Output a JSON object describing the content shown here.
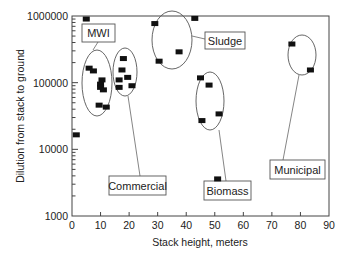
{
  "chart_data": {
    "type": "scatter",
    "title": "",
    "xlabel": "Stack height, meters",
    "ylabel": "Dilution from stack to ground",
    "xlim": [
      0,
      90
    ],
    "ylim": [
      1000,
      1000000
    ],
    "yscale": "log",
    "grid": false,
    "legend": "none",
    "x_ticks": [
      "0",
      "10",
      "20",
      "30",
      "40",
      "50",
      "60",
      "70",
      "80",
      "90"
    ],
    "y_ticks": [
      "1000",
      "10000",
      "100000",
      "1000000"
    ],
    "unlabeled_points": [
      {
        "x": 5,
        "y": 900000
      },
      {
        "x": 1.5,
        "y": 16500
      }
    ],
    "series": [
      {
        "name": "MWI",
        "points": [
          {
            "x": 6,
            "y": 165000
          },
          {
            "x": 7.5,
            "y": 150000
          },
          {
            "x": 10.5,
            "y": 110000
          },
          {
            "x": 10,
            "y": 95000
          },
          {
            "x": 10,
            "y": 85000
          },
          {
            "x": 11,
            "y": 78000
          },
          {
            "x": 9.5,
            "y": 46000
          },
          {
            "x": 12,
            "y": 43000
          }
        ]
      },
      {
        "name": "Commercial",
        "points": [
          {
            "x": 18,
            "y": 230000
          },
          {
            "x": 17.5,
            "y": 155000
          },
          {
            "x": 16.5,
            "y": 110000
          },
          {
            "x": 19.5,
            "y": 120000
          },
          {
            "x": 21,
            "y": 90000
          },
          {
            "x": 16.5,
            "y": 85000
          }
        ]
      },
      {
        "name": "Sludge",
        "points": [
          {
            "x": 29,
            "y": 770000
          },
          {
            "x": 43,
            "y": 920000
          },
          {
            "x": 37.5,
            "y": 290000
          },
          {
            "x": 30.5,
            "y": 210000
          }
        ]
      },
      {
        "name": "Biomass",
        "points": [
          {
            "x": 45,
            "y": 118000
          },
          {
            "x": 48,
            "y": 92000
          },
          {
            "x": 51.5,
            "y": 34000
          },
          {
            "x": 45.5,
            "y": 27000
          },
          {
            "x": 51,
            "y": 3600
          }
        ]
      },
      {
        "name": "Municipal",
        "points": [
          {
            "x": 77,
            "y": 380000
          },
          {
            "x": 83.5,
            "y": 155000
          }
        ]
      }
    ],
    "annotations": [
      {
        "text": "MWI",
        "box": [
          82,
          24,
          33,
          18
        ],
        "ellipse": [
          97,
          83,
          15,
          33
        ],
        "leader": [
          [
            98,
            42
          ],
          [
            93,
            50
          ]
        ]
      },
      {
        "text": "Commercial",
        "box": [
          109,
          176,
          57,
          19
        ],
        "ellipse": [
          125,
          72,
          12,
          24
        ],
        "leader": [
          [
            128,
            96
          ],
          [
            140,
            176
          ]
        ]
      },
      {
        "text": "Sludge",
        "box": [
          205,
          32,
          40,
          17
        ],
        "ellipse": [
          172,
          40,
          20,
          29
        ],
        "leader": [
          [
            192,
            36
          ],
          [
            205,
            39
          ]
        ]
      },
      {
        "text": "Biomass",
        "box": [
          204,
          181,
          47,
          19
        ],
        "ellipse": [
          210,
          101,
          14,
          29
        ],
        "leader": [
          [
            219,
            130
          ],
          [
            226,
            181
          ]
        ]
      },
      {
        "text": "Municipal",
        "box": [
          270,
          160,
          55,
          19
        ],
        "ellipse": [
          302,
          55,
          14,
          20
        ],
        "leader": [
          [
            299,
            75
          ],
          [
            283,
            160
          ]
        ]
      }
    ]
  },
  "axes": {
    "x_label": "Stack height, meters",
    "y_label": "Dilution from stack to ground"
  }
}
